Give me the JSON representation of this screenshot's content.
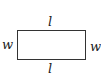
{
  "diagram": {
    "shape": "rectangle",
    "labels": {
      "top": "l",
      "bottom": "l",
      "left": "w",
      "right": "w"
    }
  }
}
